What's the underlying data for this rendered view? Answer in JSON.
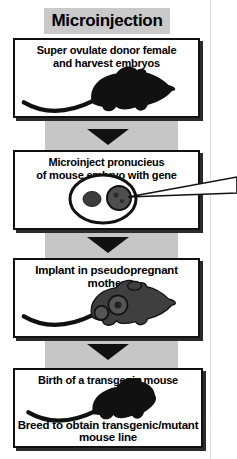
{
  "title": "Microinjection",
  "steps": [
    {
      "name": "superovulate",
      "line1": "Super ovulate donor female",
      "line2": "and harvest embryos",
      "illustration": "donor-mouse-silhouette"
    },
    {
      "name": "microinject",
      "line1": "Microinject pronucieus",
      "line2": "of mouse embryo with gene",
      "illustration": "embryo-with-micropipette"
    },
    {
      "name": "implant",
      "line1": "Implant in pseudopregnant mother",
      "illustration": "pregnant-mouse"
    },
    {
      "name": "birth-and-breed",
      "line1": "Birth of a transgenic mouse",
      "line2": "Breed to obtain transgenic/mutant",
      "line3": "mouse line",
      "illustration": "transgenic-mouse-silhouette"
    }
  ],
  "arrows": {
    "count": 3,
    "direction": "down",
    "color": "#111111"
  },
  "colors": {
    "band_gray": "#c6c6c6",
    "title_background": "#c9c9c9",
    "box_background": "#ffffff",
    "border_black": "#111111",
    "shadow": "#2b2b2b",
    "text": "#000000",
    "pregnant_mouse_body": "#3f3f3f",
    "pronucleus_dark": "#3c3c3c",
    "pronucleus_light": "#4f4f4f",
    "fold_line": "#dcdcdc"
  }
}
